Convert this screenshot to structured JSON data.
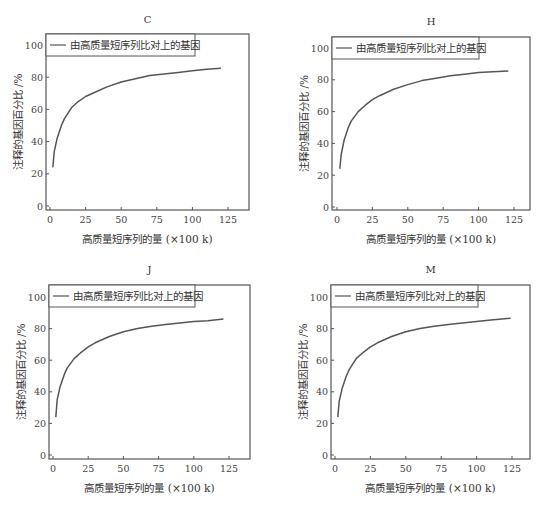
{
  "figure": {
    "panels_order": [
      "C",
      "H",
      "J",
      "M"
    ]
  },
  "chart_data": [
    {
      "type": "line",
      "title": "C",
      "xlabel": "高质量短序列的量 (×100 k)",
      "ylabel": "注释的基因百分比 /%",
      "xlim": [
        -2,
        138
      ],
      "ylim": [
        -2,
        108
      ],
      "xticks": [
        0,
        25,
        50,
        75,
        100,
        125
      ],
      "yticks": [
        0,
        20,
        40,
        60,
        80,
        100
      ],
      "legend": {
        "position": "upper left",
        "entries": [
          "由高质量短序列比对上的基因"
        ]
      },
      "grid": false,
      "series": [
        {
          "name": "由高质量短序列比对上的基因",
          "x": [
            2,
            3,
            5,
            8,
            10,
            15,
            20,
            25,
            30,
            40,
            50,
            60,
            70,
            80,
            90,
            100,
            110,
            120
          ],
          "y": [
            24,
            34,
            42,
            50,
            54,
            61,
            65,
            68,
            70,
            74,
            77,
            79,
            81,
            82,
            83,
            84,
            85,
            85.5
          ]
        }
      ]
    },
    {
      "type": "line",
      "title": "H",
      "xlabel": "高质量短序列的量 (×100 k)",
      "ylabel": "注释的基因百分比 /%",
      "xlim": [
        -2,
        138
      ],
      "ylim": [
        -2,
        108
      ],
      "xticks": [
        0,
        25,
        50,
        75,
        100,
        125
      ],
      "yticks": [
        0,
        20,
        40,
        60,
        80,
        100
      ],
      "legend": {
        "position": "upper left",
        "entries": [
          "由高质量短序列比对上的基因"
        ]
      },
      "grid": false,
      "series": [
        {
          "name": "由高质量短序列比对上的基因",
          "x": [
            2,
            3,
            5,
            8,
            10,
            15,
            20,
            25,
            30,
            40,
            50,
            60,
            70,
            80,
            90,
            100,
            110,
            121
          ],
          "y": [
            24,
            33,
            42,
            50,
            54,
            60,
            64,
            67.5,
            70,
            74,
            77,
            79.5,
            81,
            82.5,
            83.5,
            84.5,
            85,
            85.5
          ]
        }
      ]
    },
    {
      "type": "line",
      "title": "J",
      "xlabel": "高质量短序列的量 (×100 k)",
      "ylabel": "注释的基因百分比 /%",
      "xlim": [
        -2,
        138
      ],
      "ylim": [
        -2,
        108
      ],
      "xticks": [
        0,
        25,
        50,
        75,
        100,
        125
      ],
      "yticks": [
        0,
        20,
        40,
        60,
        80,
        100
      ],
      "legend": {
        "position": "upper left",
        "entries": [
          "由高质量短序列比对上的基因"
        ]
      },
      "grid": false,
      "series": [
        {
          "name": "由高质量短序列比对上的基因",
          "x": [
            2,
            3,
            5,
            8,
            10,
            15,
            20,
            25,
            30,
            40,
            50,
            60,
            70,
            80,
            90,
            100,
            110,
            121
          ],
          "y": [
            24,
            35,
            43,
            51,
            55,
            61,
            65,
            68.5,
            71,
            75,
            78,
            80,
            81.5,
            82.5,
            83.5,
            84.5,
            85,
            86
          ]
        }
      ]
    },
    {
      "type": "line",
      "title": "M",
      "xlabel": "高质量短序列的量 (×100 k)",
      "ylabel": "注释的基因百分比 /%",
      "xlim": [
        -2,
        138
      ],
      "ylim": [
        -2,
        108
      ],
      "xticks": [
        0,
        25,
        50,
        75,
        100,
        125
      ],
      "yticks": [
        0,
        20,
        40,
        60,
        80,
        100
      ],
      "legend": {
        "position": "upper left",
        "entries": [
          "由高质量短序列比对上的基因"
        ]
      },
      "grid": false,
      "series": [
        {
          "name": "由高质量短序列比对上的基因",
          "x": [
            2,
            3,
            5,
            8,
            10,
            15,
            20,
            25,
            30,
            40,
            50,
            60,
            70,
            80,
            90,
            100,
            110,
            124
          ],
          "y": [
            24,
            34,
            42,
            50,
            54,
            61,
            65,
            68.5,
            71,
            75,
            78,
            80,
            81.5,
            82.5,
            83.5,
            84.5,
            85.5,
            86.5
          ]
        }
      ]
    }
  ],
  "layout": {
    "panels": [
      {
        "left": 46,
        "top": 34,
        "right": 249,
        "bottom": 210,
        "x0": 50,
        "x125": 228,
        "y0": 206,
        "y100": 45,
        "legend_right": 195,
        "legend_bottom": 56,
        "title_y": 23
      },
      {
        "left": 332,
        "top": 37,
        "right": 530,
        "bottom": 210,
        "x0": 337,
        "x125": 514,
        "y0": 207,
        "y100": 48,
        "legend_right": 479,
        "legend_bottom": 59,
        "title_y": 25
      },
      {
        "left": 49,
        "top": 285,
        "right": 250,
        "bottom": 459,
        "x0": 53,
        "x125": 229,
        "y0": 455,
        "y100": 297,
        "legend_right": 195,
        "legend_bottom": 307,
        "title_y": 273
      },
      {
        "left": 331,
        "top": 285,
        "right": 530,
        "bottom": 459,
        "x0": 335,
        "x125": 512,
        "y0": 455,
        "y100": 297,
        "legend_right": 478,
        "legend_bottom": 307,
        "title_y": 273
      }
    ],
    "line_color": "#555555",
    "frame_color": "#555555"
  }
}
